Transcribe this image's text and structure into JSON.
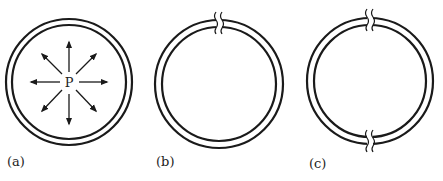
{
  "figure": {
    "panels": [
      {
        "id": "a",
        "label": "(a)",
        "center_label": "P",
        "breaks": 0,
        "arrows": 8
      },
      {
        "id": "b",
        "label": "(b)",
        "breaks": 1,
        "break_positions": [
          "top"
        ]
      },
      {
        "id": "c",
        "label": "(c)",
        "breaks": 2,
        "break_positions": [
          "top",
          "bottom"
        ]
      }
    ],
    "stroke_color": "#1a1a1a",
    "background": "#ffffff"
  }
}
